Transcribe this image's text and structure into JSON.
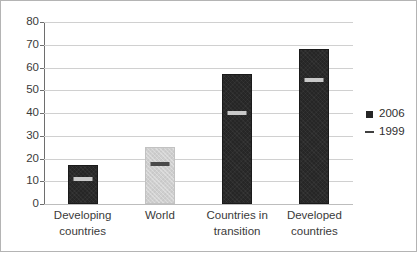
{
  "chart_data": {
    "type": "bar",
    "title": "",
    "xlabel": "",
    "ylabel": "",
    "ylim": [
      0,
      80
    ],
    "yticks": [
      0,
      10,
      20,
      30,
      40,
      50,
      60,
      70,
      80
    ],
    "grid": true,
    "legend_position": "right",
    "categories": [
      "Developing countries",
      "World",
      "Countries in transition",
      "Developed countries"
    ],
    "category_lines": [
      [
        "Developing",
        "countries"
      ],
      [
        "World",
        ""
      ],
      [
        "Countries in",
        "transition"
      ],
      [
        "Developed",
        "countries"
      ]
    ],
    "series": [
      {
        "name": "2006",
        "marker": "square",
        "render": "bar",
        "values": [
          17,
          25,
          57,
          68
        ],
        "colors": [
          "#262626",
          "#cfcfcf",
          "#262626",
          "#262626"
        ]
      },
      {
        "name": "1999",
        "marker": "dash",
        "render": "marker",
        "values": [
          11,
          18,
          40,
          55
        ]
      }
    ]
  },
  "legend": {
    "items": [
      {
        "label": "2006",
        "key": "square-marker",
        "color": "#262626"
      },
      {
        "label": "1999",
        "key": "dash-marker",
        "color": "#404040"
      }
    ]
  },
  "axis": {
    "y_tick_labels": [
      "80",
      "70",
      "60",
      "50",
      "40",
      "30",
      "20",
      "10",
      "0"
    ]
  }
}
